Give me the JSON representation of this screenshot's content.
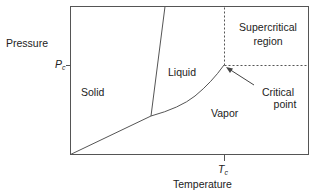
{
  "diagram": {
    "type": "phase-diagram",
    "axes": {
      "y_label": "Pressure",
      "x_label": "Temperature",
      "y_tick": {
        "symbol": "P",
        "subscript": "c"
      },
      "x_tick": {
        "symbol": "T",
        "subscript": "c"
      }
    },
    "regions": {
      "solid": "Solid",
      "liquid": "Liquid",
      "vapor": "Vapor",
      "supercritical_line1": "Supercritical",
      "supercritical_line2": "region"
    },
    "annotations": {
      "critical_point_line1": "Critical",
      "critical_point_line2": "point"
    },
    "colors": {
      "line": "#444444",
      "text": "#222222",
      "background": "#ffffff"
    }
  }
}
